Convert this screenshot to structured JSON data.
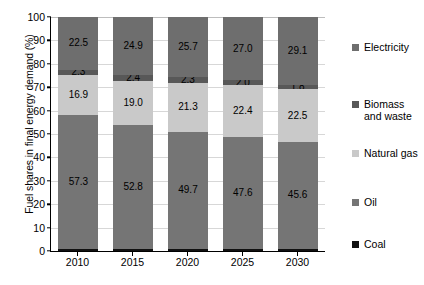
{
  "chart_data": {
    "type": "bar",
    "subtype": "stacked-100-percent",
    "title": "",
    "xlabel": "",
    "ylabel": "Fuel shares in final energy demand (%)",
    "ylim": [
      0,
      100
    ],
    "yticks": [
      0,
      10,
      20,
      30,
      40,
      50,
      60,
      70,
      80,
      90,
      100
    ],
    "grid": true,
    "legend_position": "right",
    "categories": [
      "2010",
      "2015",
      "2020",
      "2025",
      "2030"
    ],
    "series": [
      {
        "name": "Coal",
        "color": "#111111",
        "values": [
          1.0,
          0.9,
          1.0,
          1.0,
          1.0
        ],
        "labels": [
          "",
          "",
          "",
          "",
          ""
        ]
      },
      {
        "name": "Oil",
        "color": "#757575",
        "values": [
          57.3,
          52.8,
          49.7,
          47.6,
          45.6
        ],
        "labels": [
          "57.3",
          "52.8",
          "49.7",
          "47.6",
          "45.6"
        ]
      },
      {
        "name": "Natural gas",
        "color": "#c9c9c9",
        "values": [
          16.9,
          19.0,
          21.3,
          22.4,
          22.5
        ],
        "labels": [
          "16.9",
          "19.0",
          "21.3",
          "22.4",
          "22.5"
        ]
      },
      {
        "name": "Biomass and waste",
        "color": "#585858",
        "values": [
          2.3,
          2.4,
          2.3,
          2.0,
          1.8
        ],
        "labels": [
          "2.3",
          "2.4",
          "2.3",
          "2.0",
          "1.8"
        ]
      },
      {
        "name": "Electricity",
        "color": "#6e6e6e",
        "values": [
          22.5,
          24.9,
          25.7,
          27.0,
          29.1
        ],
        "labels": [
          "22.5",
          "24.9",
          "25.7",
          "27.0",
          "29.1"
        ]
      }
    ]
  },
  "legend": {
    "items": [
      {
        "label": "Electricity",
        "color": "#6e6e6e",
        "top": 25
      },
      {
        "label": "Biomass\nand waste",
        "color": "#585858",
        "top": 82
      },
      {
        "label": "Natural gas",
        "color": "#c9c9c9",
        "top": 131
      },
      {
        "label": "Oil",
        "color": "#757575",
        "top": 180
      },
      {
        "label": "Coal",
        "color": "#111111",
        "top": 222
      }
    ]
  }
}
